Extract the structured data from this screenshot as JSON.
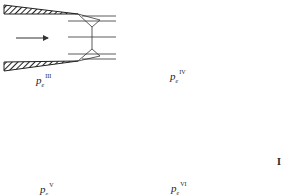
{
  "figure": {
    "panels": [
      {
        "id": "III",
        "label_base": "p",
        "label_sub": "e",
        "label_sup": "III",
        "pattern": "Mach disk with reflected shocks"
      },
      {
        "id": "IV",
        "label_base": "p",
        "label_sub": "e",
        "label_sup": "IV",
        "pattern": "oblique shocks meeting at a point"
      },
      {
        "id": "V",
        "label_base": "p",
        "label_sub": "e",
        "label_sup": "V",
        "pattern": "no shocks, ideal expansion"
      },
      {
        "id": "VI",
        "label_base": "p",
        "label_sub": "e",
        "label_sup": "VI",
        "pattern": "expansion fans"
      }
    ],
    "side_mark": "I",
    "colors": {
      "ink": "#222222",
      "background": "#ffffff"
    }
  }
}
